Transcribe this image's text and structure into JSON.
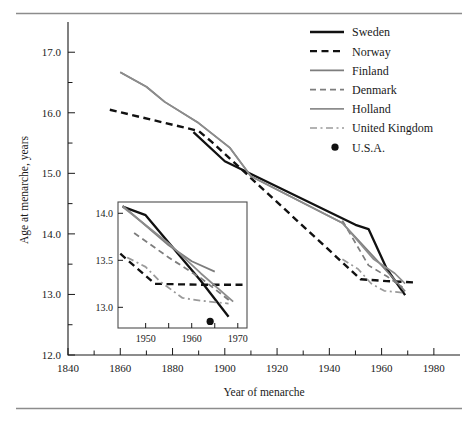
{
  "figure": {
    "title": "",
    "axis_x_label": "Year of menarche",
    "axis_y_label": "Age at menarche, years"
  },
  "legend": {
    "entries": [
      {
        "label": "Sweden",
        "color": "#111111",
        "style": "solid",
        "width": 2.3
      },
      {
        "label": "Norway",
        "color": "#111111",
        "style": "dashed",
        "width": 2.3
      },
      {
        "label": "Finland",
        "color": "#7d7d7d",
        "style": "solid",
        "width": 1.7
      },
      {
        "label": "Denmark",
        "color": "#7d7d7d",
        "style": "dashed",
        "width": 1.7
      },
      {
        "label": "Holland",
        "color": "#8c8c8c",
        "style": "solid",
        "width": 1.7
      },
      {
        "label": "United Kingdom",
        "color": "#9a9a9a",
        "style": "dashdot",
        "width": 1.7
      },
      {
        "label": "U.S.A.",
        "color": "#111111",
        "style": "dot",
        "width": 0
      }
    ]
  },
  "chart_data": {
    "type": "line",
    "title": "",
    "xlabel": "Year of menarche",
    "ylabel": "Age at menarche, years",
    "xlim": [
      1840,
      1990
    ],
    "ylim": [
      12.0,
      17.4
    ],
    "xticks": [
      1840,
      1850,
      1860,
      1870,
      1880,
      1890,
      1900,
      1910,
      1920,
      1930,
      1940,
      1950,
      1960,
      1970,
      1980
    ],
    "xticklabels": [
      "1840",
      "",
      "1860",
      "",
      "1880",
      "",
      "1900",
      "",
      "1920",
      "",
      "1940",
      "",
      "1960",
      "",
      "1980"
    ],
    "yticks": [
      12.0,
      12.5,
      13.0,
      13.5,
      14.0,
      14.5,
      15.0,
      15.5,
      16.0,
      16.5,
      17.0
    ],
    "yticklabels": [
      "12.0",
      "",
      "13.0",
      "",
      "14.0",
      "",
      "15.0",
      "",
      "16.0",
      "",
      "17.0"
    ],
    "grid": false,
    "legend_position": "top-right",
    "series": [
      {
        "name": "Sweden",
        "color": "#111111",
        "style": "solid",
        "points": [
          [
            1888,
            15.68
          ],
          [
            1900,
            15.2
          ],
          [
            1950,
            14.15
          ],
          [
            1955,
            14.08
          ],
          [
            1962,
            13.42
          ],
          [
            1969,
            12.99
          ]
        ]
      },
      {
        "name": "Norway",
        "color": "#111111",
        "style": "dashed",
        "points": [
          [
            1856,
            16.05
          ],
          [
            1890,
            15.7
          ],
          [
            1895,
            15.52
          ],
          [
            1952,
            13.25
          ],
          [
            1962,
            13.22
          ],
          [
            1972,
            13.2
          ]
        ]
      },
      {
        "name": "Finland",
        "color": "#7d7d7d",
        "style": "solid",
        "points": [
          [
            1860,
            16.67
          ],
          [
            1870,
            16.43
          ],
          [
            1877,
            16.18
          ],
          [
            1890,
            15.83
          ],
          [
            1902,
            15.42
          ],
          [
            1910,
            14.95
          ],
          [
            1945,
            14.18
          ],
          [
            1960,
            13.48
          ],
          [
            1969,
            13.05
          ]
        ]
      },
      {
        "name": "Denmark",
        "color": "#7d7d7d",
        "style": "dashed",
        "points": [
          [
            1945,
            14.22
          ],
          [
            1955,
            13.48
          ],
          [
            1962,
            13.3
          ],
          [
            1968,
            13.12
          ]
        ]
      },
      {
        "name": "Holland",
        "color": "#8c8c8c",
        "style": "solid",
        "points": [
          [
            1860,
            16.67
          ],
          [
            1870,
            16.43
          ],
          [
            1877,
            16.18
          ],
          [
            1890,
            15.83
          ],
          [
            1902,
            15.42
          ],
          [
            1910,
            14.95
          ],
          [
            1945,
            14.18
          ],
          [
            1957,
            13.58
          ],
          [
            1965,
            13.35
          ],
          [
            1969,
            13.18
          ]
        ]
      },
      {
        "name": "United Kingdom",
        "color": "#9a9a9a",
        "style": "dashdot",
        "points": [
          [
            1945,
            13.58
          ],
          [
            1951,
            13.42
          ],
          [
            1956,
            13.18
          ],
          [
            1961,
            13.06
          ],
          [
            1968,
            13.03
          ]
        ]
      }
    ],
    "point_markers": [
      {
        "name": "U.S.A.",
        "x": 1898,
        "y": 12.73,
        "color": "#111111"
      }
    ]
  },
  "inset": {
    "xlim": [
      1944,
      1972
    ],
    "ylim": [
      12.78,
      14.12
    ],
    "xticks": [
      1950,
      1955,
      1960,
      1965,
      1970
    ],
    "xticklabels": [
      "1950",
      "",
      "1960",
      "",
      "1970"
    ],
    "yticks": [
      13.0,
      13.5,
      14.0
    ],
    "yticklabels": [
      "13.0",
      "13.5",
      "14.0"
    ],
    "series": [
      {
        "name": "Sweden",
        "color": "#111111",
        "style": "solid",
        "points": [
          [
            1945,
            14.07
          ],
          [
            1950,
            13.98
          ],
          [
            1962,
            13.28
          ],
          [
            1968,
            12.9
          ]
        ]
      },
      {
        "name": "Norway",
        "color": "#111111",
        "style": "dashed",
        "points": [
          [
            1944.5,
            13.57
          ],
          [
            1952,
            13.25
          ],
          [
            1962,
            13.24
          ],
          [
            1971.5,
            13.24
          ]
        ]
      },
      {
        "name": "Finland",
        "color": "#7d7d7d",
        "style": "solid",
        "points": [
          [
            1945,
            14.08
          ],
          [
            1955,
            13.66
          ],
          [
            1960,
            13.49
          ],
          [
            1965,
            13.38
          ]
        ]
      },
      {
        "name": "Denmark",
        "color": "#7d7d7d",
        "style": "dashed",
        "points": [
          [
            1947.5,
            13.79
          ],
          [
            1955,
            13.53
          ],
          [
            1962,
            13.31
          ],
          [
            1968.5,
            13.06
          ]
        ]
      },
      {
        "name": "Holland",
        "color": "#8c8c8c",
        "style": "solid",
        "points": [
          [
            1945,
            14.07
          ],
          [
            1955,
            13.68
          ],
          [
            1962,
            13.36
          ],
          [
            1969,
            13.06
          ]
        ]
      },
      {
        "name": "United Kingdom",
        "color": "#9a9a9a",
        "style": "dashdot",
        "points": [
          [
            1946,
            13.53
          ],
          [
            1950,
            13.43
          ],
          [
            1953,
            13.28
          ],
          [
            1958,
            13.1
          ],
          [
            1962,
            13.07
          ],
          [
            1968,
            13.04
          ]
        ]
      }
    ],
    "point_markers": [
      {
        "name": "U.S.A.",
        "x": 1964,
        "y": 12.85,
        "color": "#111111"
      }
    ]
  }
}
